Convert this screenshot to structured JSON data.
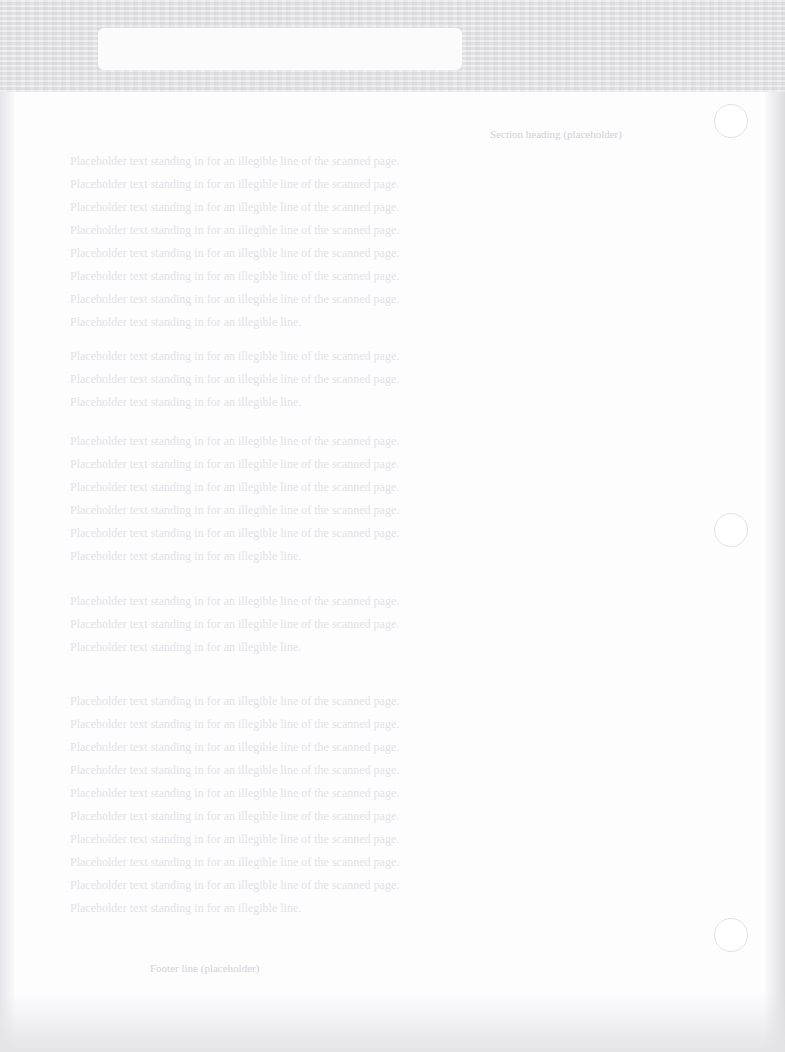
{
  "document": {
    "type": "scanned-page",
    "legibility": "illegible",
    "text_note": "Text on the scan cannot be read at any zoom level. Every string in heading, paragraphs and footer below is placeholder filler written for this recreation; none of it is transcribed from the image.",
    "label_box_text": "",
    "top_strip_text": "",
    "heading": "Section heading (placeholder)",
    "paragraphs": [
      {
        "lines": [
          "Placeholder text standing in for an illegible line of the scanned page.",
          "Placeholder text standing in for an illegible line of the scanned page.",
          "Placeholder text standing in for an illegible line of the scanned page.",
          "Placeholder text standing in for an illegible line of the scanned page.",
          "Placeholder text standing in for an illegible line of the scanned page.",
          "Placeholder text standing in for an illegible line of the scanned page.",
          "Placeholder text standing in for an illegible line of the scanned page.",
          "Placeholder text standing in for an illegible line."
        ]
      },
      {
        "lines": [
          "Placeholder text standing in for an illegible line of the scanned page.",
          "Placeholder text standing in for an illegible line of the scanned page.",
          "Placeholder text standing in for an illegible line."
        ]
      },
      {
        "lines": [
          "Placeholder text standing in for an illegible line of the scanned page.",
          "Placeholder text standing in for an illegible line of the scanned page.",
          "Placeholder text standing in for an illegible line of the scanned page.",
          "Placeholder text standing in for an illegible line of the scanned page.",
          "Placeholder text standing in for an illegible line of the scanned page.",
          "Placeholder text standing in for an illegible line."
        ]
      },
      {
        "lines": [
          "Placeholder text standing in for an illegible line of the scanned page.",
          "Placeholder text standing in for an illegible line of the scanned page.",
          "Placeholder text standing in for an illegible line."
        ]
      },
      {
        "lines": [
          "Placeholder text standing in for an illegible line of the scanned page.",
          "Placeholder text standing in for an illegible line of the scanned page.",
          "Placeholder text standing in for an illegible line of the scanned page.",
          "Placeholder text standing in for an illegible line of the scanned page.",
          "Placeholder text standing in for an illegible line of the scanned page.",
          "Placeholder text standing in for an illegible line of the scanned page.",
          "Placeholder text standing in for an illegible line of the scanned page.",
          "Placeholder text standing in for an illegible line of the scanned page.",
          "Placeholder text standing in for an illegible line of the scanned page.",
          "Placeholder text standing in for an illegible line."
        ]
      }
    ],
    "footer": "Footer line (placeholder)",
    "binder_holes": 3
  }
}
